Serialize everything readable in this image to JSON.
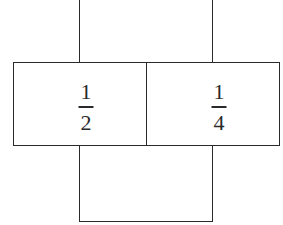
{
  "diagram": {
    "type": "cross-shaped net of boxes",
    "colors": {
      "line": "#2a2a2a",
      "background": "#ffffff"
    },
    "cells": [
      {
        "position": "middle-left",
        "fraction": {
          "numerator": "1",
          "denominator": "2"
        }
      },
      {
        "position": "middle-right",
        "fraction": {
          "numerator": "1",
          "denominator": "4"
        }
      },
      {
        "position": "top",
        "label": ""
      },
      {
        "position": "bottom",
        "label": ""
      }
    ]
  }
}
